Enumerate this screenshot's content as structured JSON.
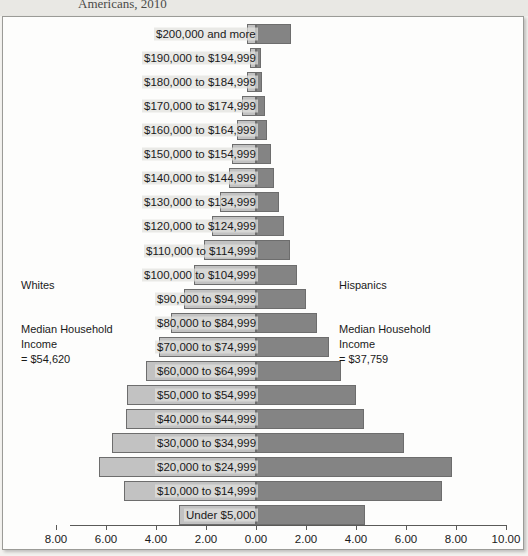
{
  "page": {
    "clipped_title": "Americans, 2010"
  },
  "annotations": {
    "left": {
      "group": "Whites",
      "median_label": "Median Household\nIncome\n= $54,620",
      "median_value": "$54,620"
    },
    "right": {
      "group": "Hispanics",
      "median_label": "Median Household\nIncome\n= $37,759",
      "median_value": "$37,759"
    }
  },
  "colors": {
    "left_bar": "#c2c2c2",
    "right_bar": "#848484",
    "bar_outline": "#6d6d6d",
    "axis": "#5a5a58",
    "card_background": "#fdfdfc",
    "page_background": "#f3f2ef"
  },
  "chart_data": {
    "type": "bar",
    "subtype": "population-pyramid",
    "title": "Americans, 2010",
    "xlabel": "",
    "ylabel": "",
    "orientation": "horizontal",
    "grid": false,
    "legend_position": "none",
    "axis_ticks": [
      {
        "label": "8.00",
        "value": -8
      },
      {
        "label": "6.00",
        "value": -6
      },
      {
        "label": "4.00",
        "value": -4
      },
      {
        "label": "2.00",
        "value": -2
      },
      {
        "label": "0.00",
        "value": 0
      },
      {
        "label": "2.00",
        "value": 2
      },
      {
        "label": "4.00",
        "value": 4
      },
      {
        "label": "6.00",
        "value": 6
      },
      {
        "label": "8.00",
        "value": 8
      },
      {
        "label": "10.00",
        "value": 10
      }
    ],
    "xlim": [
      -8.8,
      10.4
    ],
    "categories": [
      "$200,000 and more",
      "$190,000 to $194,999",
      "$180,000 to $184,999",
      "$170,000 to $174,999",
      "$160,000 to $164,999",
      "$150,000 to $154,999",
      "$140,000 to $144,999",
      "$130,000 to $134,999",
      "$120,000 to $124,999",
      "$110,000 to $114,999",
      "$100,000 to $104,999",
      "$90,000 to $94,999",
      "$80,000 to $84,999",
      "$70,000 to $74,999",
      "$60,000 to $64,999",
      "$50,000 to $54,999",
      "$40,000 to $44,999",
      "$30,000 to $34,999",
      "$20,000 to $24,999",
      "$10,000 to $14,999",
      "Under $5,000"
    ],
    "series": [
      {
        "name": "Whites",
        "side": "left",
        "color": "#c2c2c2",
        "values": [
          0.35,
          0.25,
          0.35,
          0.55,
          0.75,
          0.95,
          1.1,
          1.45,
          1.75,
          2.1,
          2.5,
          2.9,
          3.4,
          3.9,
          4.4,
          5.15,
          5.2,
          5.75,
          6.3,
          5.3,
          3.1
        ]
      },
      {
        "name": "Hispanics",
        "side": "right",
        "color": "#848484",
        "values": [
          1.4,
          0.2,
          0.25,
          0.35,
          0.45,
          0.6,
          0.7,
          0.9,
          1.1,
          1.35,
          1.65,
          2.0,
          2.45,
          2.9,
          3.4,
          4.0,
          4.3,
          5.9,
          7.85,
          7.45,
          4.35
        ]
      }
    ]
  }
}
